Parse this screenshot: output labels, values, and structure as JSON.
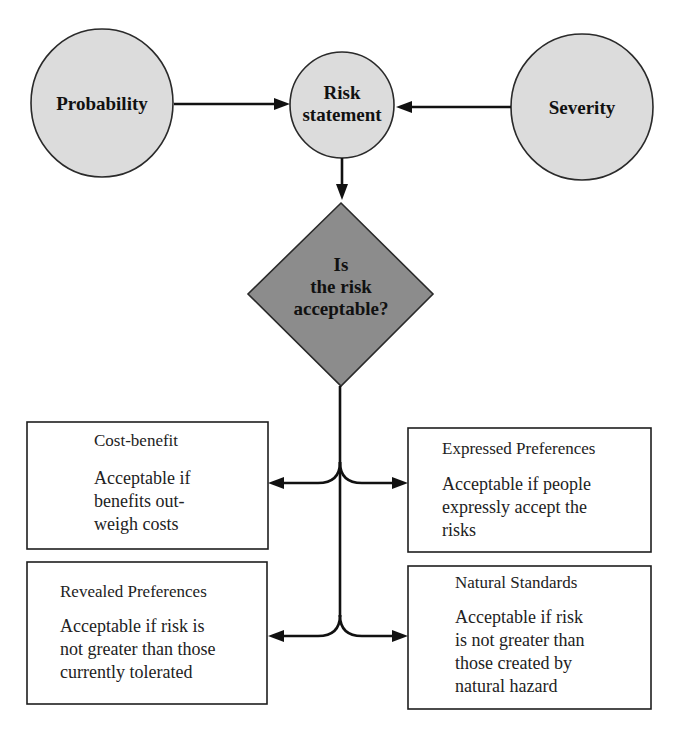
{
  "diagram": {
    "nodes": {
      "probability": {
        "label": "Probability"
      },
      "risk_statement": {
        "label_line1": "Risk",
        "label_line2": "statement"
      },
      "severity": {
        "label": "Severity"
      },
      "decision": {
        "label_line1": "Is",
        "label_line2": "the risk",
        "label_line3": "acceptable?"
      }
    },
    "criteria": [
      {
        "title": "Cost-benefit",
        "body": [
          "Acceptable if",
          "benefits out-",
          "weigh costs"
        ]
      },
      {
        "title": "Expressed Preferences",
        "body": [
          "Acceptable if people",
          "expressly accept the",
          "risks"
        ]
      },
      {
        "title": "Revealed Preferences",
        "body": [
          "Acceptable if risk is",
          "not greater than those",
          "currently tolerated"
        ]
      },
      {
        "title": "Natural Standards",
        "body": [
          "Acceptable if risk",
          "is not greater than",
          "those created by",
          "natural hazard"
        ]
      }
    ],
    "edges": [
      {
        "from": "Probability",
        "to": "Risk statement"
      },
      {
        "from": "Severity",
        "to": "Risk statement"
      },
      {
        "from": "Risk statement",
        "to": "Is the risk acceptable?"
      },
      {
        "from": "Is the risk acceptable?",
        "to": "Cost-benefit"
      },
      {
        "from": "Is the risk acceptable?",
        "to": "Expressed Preferences"
      },
      {
        "from": "Is the risk acceptable?",
        "to": "Revealed Preferences"
      },
      {
        "from": "Is the risk acceptable?",
        "to": "Natural Standards"
      }
    ],
    "colors": {
      "ellipse_fill": "#dcdcdc",
      "diamond_fill": "#8c8c8c",
      "stroke": "#1e1e1e",
      "background": "#ffffff"
    }
  }
}
